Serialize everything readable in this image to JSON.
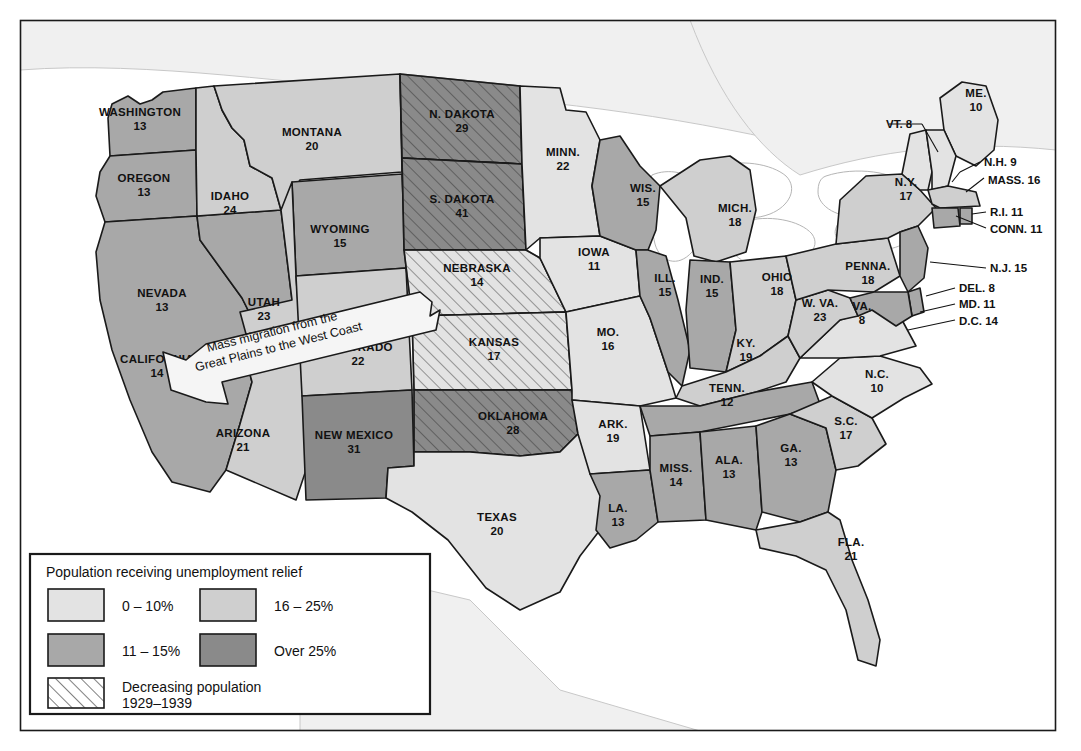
{
  "map": {
    "title_hidden": "",
    "legend": {
      "title": "Population receiving unemployment relief",
      "items": [
        {
          "label": "0 – 10%",
          "key": "c1",
          "color": "#e3e3e3"
        },
        {
          "label": "16 – 25%",
          "key": "c3",
          "color": "#cfcfcf"
        },
        {
          "label": "11 – 15%",
          "key": "c2",
          "color": "#a8a8a8"
        },
        {
          "label": "Over 25%",
          "key": "c4",
          "color": "#8a8a8a"
        }
      ],
      "hatch": {
        "label_line1": "Decreasing population",
        "label_line2": "1929–1939"
      }
    },
    "annotation": {
      "line1": "Mass migration from the",
      "line2": "Great Plains to the West Coast"
    },
    "states": [
      {
        "name": "WASHINGTON",
        "value": "13",
        "tone": "c2",
        "hatch": false
      },
      {
        "name": "OREGON",
        "value": "13",
        "tone": "c2",
        "hatch": false
      },
      {
        "name": "CALIFORNIA",
        "value": "14",
        "tone": "c2",
        "hatch": false
      },
      {
        "name": "NEVADA",
        "value": "13",
        "tone": "c2",
        "hatch": false
      },
      {
        "name": "IDAHO",
        "value": "24",
        "tone": "c3",
        "hatch": false
      },
      {
        "name": "MONTANA",
        "value": "20",
        "tone": "c3",
        "hatch": false
      },
      {
        "name": "WYOMING",
        "value": "15",
        "tone": "c2",
        "hatch": false
      },
      {
        "name": "UTAH",
        "value": "23",
        "tone": "c3",
        "hatch": false
      },
      {
        "name": "ARIZONA",
        "value": "21",
        "tone": "c3",
        "hatch": false
      },
      {
        "name": "COLORADO",
        "value": "22",
        "tone": "c3",
        "hatch": false
      },
      {
        "name": "NEW MEXICO",
        "value": "31",
        "tone": "c4",
        "hatch": false
      },
      {
        "name": "N. DAKOTA",
        "value": "29",
        "tone": "c4",
        "hatch": true
      },
      {
        "name": "S. DAKOTA",
        "value": "41",
        "tone": "c4",
        "hatch": true
      },
      {
        "name": "NEBRASKA",
        "value": "14",
        "tone": "c1",
        "hatch": true
      },
      {
        "name": "KANSAS",
        "value": "17",
        "tone": "c1",
        "hatch": true
      },
      {
        "name": "OKLAHOMA",
        "value": "28",
        "tone": "c4",
        "hatch": true
      },
      {
        "name": "TEXAS",
        "value": "20",
        "tone": "c1",
        "hatch": false
      },
      {
        "name": "MINN.",
        "value": "22",
        "tone": "c1",
        "hatch": false
      },
      {
        "name": "IOWA",
        "value": "11",
        "tone": "c1",
        "hatch": false
      },
      {
        "name": "MO.",
        "value": "16",
        "tone": "c1",
        "hatch": false
      },
      {
        "name": "ARK.",
        "value": "19",
        "tone": "c1",
        "hatch": false
      },
      {
        "name": "LA.",
        "value": "13",
        "tone": "c2",
        "hatch": false
      },
      {
        "name": "WIS.",
        "value": "15",
        "tone": "c2",
        "hatch": false
      },
      {
        "name": "ILL.",
        "value": "15",
        "tone": "c2",
        "hatch": false
      },
      {
        "name": "MICH.",
        "value": "18",
        "tone": "c3",
        "hatch": false
      },
      {
        "name": "IND.",
        "value": "15",
        "tone": "c2",
        "hatch": false
      },
      {
        "name": "OHIO",
        "value": "18",
        "tone": "c3",
        "hatch": false
      },
      {
        "name": "KY.",
        "value": "19",
        "tone": "c3",
        "hatch": false
      },
      {
        "name": "TENN.",
        "value": "12",
        "tone": "c2",
        "hatch": false
      },
      {
        "name": "MISS.",
        "value": "14",
        "tone": "c2",
        "hatch": false
      },
      {
        "name": "ALA.",
        "value": "13",
        "tone": "c2",
        "hatch": false
      },
      {
        "name": "GA.",
        "value": "13",
        "tone": "c2",
        "hatch": false
      },
      {
        "name": "FLA.",
        "value": "21",
        "tone": "c3",
        "hatch": false
      },
      {
        "name": "S.C.",
        "value": "17",
        "tone": "c3",
        "hatch": false
      },
      {
        "name": "N.C.",
        "value": "10",
        "tone": "c1",
        "hatch": false
      },
      {
        "name": "VA.",
        "value": "8",
        "tone": "c1",
        "hatch": false
      },
      {
        "name": "W. VA.",
        "value": "23",
        "tone": "c3",
        "hatch": false
      },
      {
        "name": "PENNA.",
        "value": "18",
        "tone": "c3",
        "hatch": false
      },
      {
        "name": "N.Y.",
        "value": "17",
        "tone": "c3",
        "hatch": false
      },
      {
        "name": "ME.",
        "value": "10",
        "tone": "c1",
        "hatch": false
      }
    ],
    "callouts": [
      {
        "label": "VT. 8"
      },
      {
        "label": "N.H. 9"
      },
      {
        "label": "MASS. 16"
      },
      {
        "label": "R.I. 11"
      },
      {
        "label": "CONN. 11"
      },
      {
        "label": "N.J. 15"
      },
      {
        "label": "DEL. 8"
      },
      {
        "label": "MD. 11"
      },
      {
        "label": "D.C. 14"
      }
    ]
  }
}
